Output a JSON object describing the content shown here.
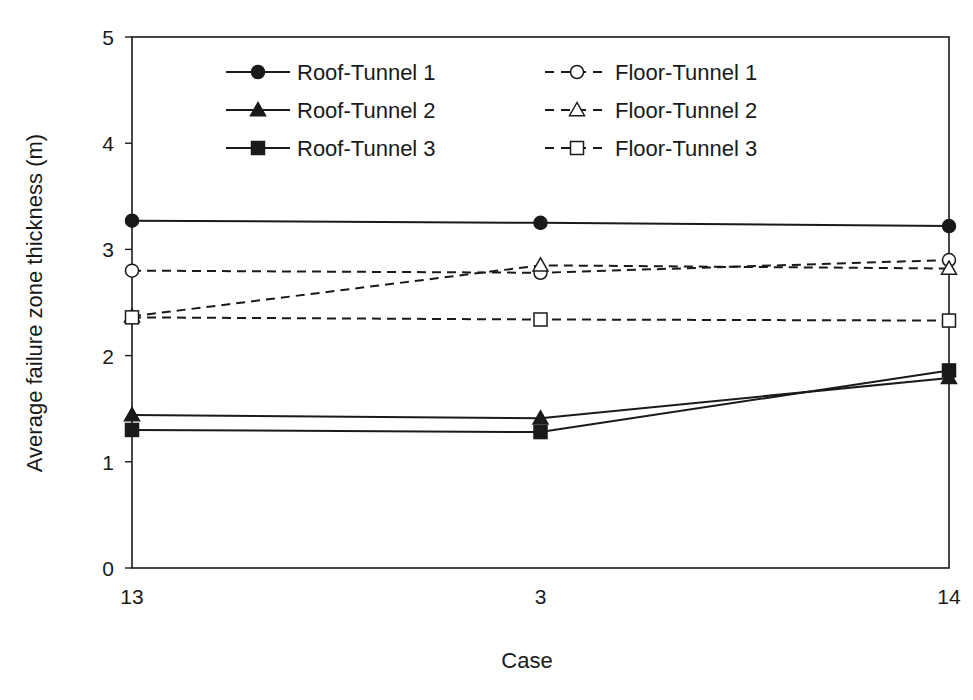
{
  "chart_data": {
    "type": "line",
    "title": "",
    "xlabel": "Case",
    "ylabel": "Average failure zone thickness (m)",
    "categories": [
      "13",
      "3",
      "14"
    ],
    "ylim": [
      0,
      5
    ],
    "yticks": [
      0,
      1,
      2,
      3,
      4,
      5
    ],
    "grid": false,
    "legend_position": "upper inside, two columns",
    "series": [
      {
        "name": "Roof-Tunnel 1",
        "marker": "filled-circle",
        "line": "solid",
        "values": [
          3.27,
          3.25,
          3.22
        ]
      },
      {
        "name": "Roof-Tunnel 2",
        "marker": "filled-triangle",
        "line": "solid",
        "values": [
          1.44,
          1.41,
          1.79
        ]
      },
      {
        "name": "Roof-Tunnel 3",
        "marker": "filled-square",
        "line": "solid",
        "values": [
          1.3,
          1.28,
          1.86
        ]
      },
      {
        "name": "Floor-Tunnel 1",
        "marker": "open-circle",
        "line": "dashed",
        "values": [
          2.8,
          2.78,
          2.9
        ]
      },
      {
        "name": "Floor-Tunnel 2",
        "marker": "open-triangle",
        "line": "dashed",
        "values": [
          2.37,
          2.85,
          2.82
        ]
      },
      {
        "name": "Floor-Tunnel 3",
        "marker": "open-square",
        "line": "dashed",
        "values": [
          2.36,
          2.34,
          2.33
        ]
      }
    ]
  },
  "colors": {
    "line": "#1a1a1a",
    "background": "#ffffff"
  }
}
